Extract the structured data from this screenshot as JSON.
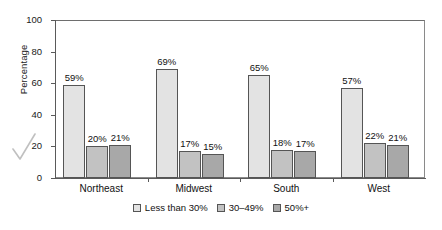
{
  "chart_data": {
    "type": "bar",
    "title": "",
    "xlabel": "",
    "ylabel": "Percentage",
    "ylim": [
      0,
      100
    ],
    "yticks": [
      0,
      20,
      40,
      60,
      80,
      100
    ],
    "grid": false,
    "legend_position": "bottom-center",
    "categories": [
      "Northeast",
      "Midwest",
      "South",
      "West"
    ],
    "series": [
      {
        "name": "Less than 30%",
        "color": "#e3e3e3",
        "values": [
          59,
          69,
          65,
          57
        ],
        "labels": [
          "59%",
          "69%",
          "65%",
          "57%"
        ]
      },
      {
        "name": "30–49%",
        "color": "#c2c2c2",
        "values": [
          20,
          17,
          18,
          22
        ],
        "labels": [
          "20%",
          "17%",
          "18%",
          "22%"
        ]
      },
      {
        "name": "50%+",
        "color": "#a8a8a8",
        "values": [
          21,
          15,
          17,
          21
        ],
        "labels": [
          "21%",
          "15%",
          "17%",
          "21%"
        ]
      }
    ]
  },
  "annotations": {
    "check_mark": "check-mark"
  }
}
